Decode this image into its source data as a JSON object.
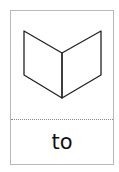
{
  "card": {
    "icon": "open-book-icon",
    "word": "to",
    "colors": {
      "border": "#b8b8b8",
      "divider": "#888888",
      "stroke": "#222222",
      "text": "#111111"
    }
  }
}
